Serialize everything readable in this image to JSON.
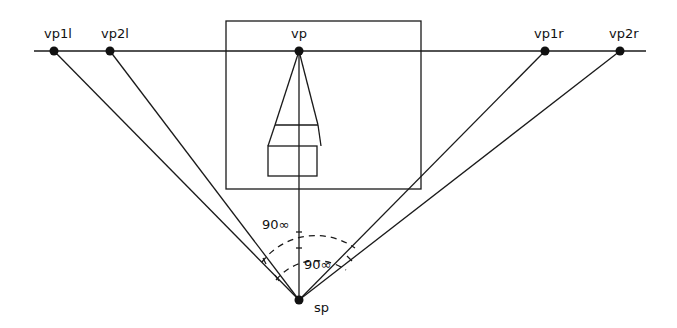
{
  "diagram": {
    "horizon": {
      "y": 51,
      "x1": 34,
      "x2": 646
    },
    "points": [
      {
        "id": "vp1l",
        "label": "vp1l",
        "x": 54,
        "y": 51
      },
      {
        "id": "vp2l",
        "label": "vp2l",
        "x": 110,
        "y": 51
      },
      {
        "id": "vp",
        "label": "vp",
        "x": 299,
        "y": 51
      },
      {
        "id": "vp1r",
        "label": "vp1r",
        "x": 545,
        "y": 51
      },
      {
        "id": "vp2r",
        "label": "vp2r",
        "x": 620,
        "y": 51
      },
      {
        "id": "sp",
        "label": "sp",
        "x": 299,
        "y": 300
      }
    ],
    "picture_frame": {
      "x": 226,
      "y": 21,
      "width": 195,
      "height": 168
    },
    "angle_labels": [
      {
        "text": "90∞",
        "x": 262,
        "y": 232
      },
      {
        "text": "90∞",
        "x": 303,
        "y": 268
      }
    ],
    "colors": {
      "line": "#1a1a1a",
      "background": "#ffffff"
    }
  }
}
